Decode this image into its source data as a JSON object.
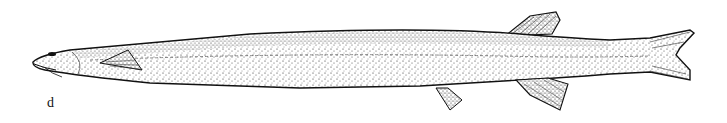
{
  "figure": {
    "panel_label": "d",
    "colors": {
      "ink": "#111111",
      "background": "#ffffff"
    }
  }
}
